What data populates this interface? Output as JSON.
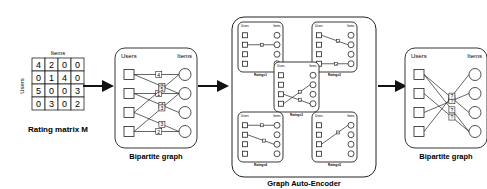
{
  "matrix": {
    "caption": "Rating matrix M",
    "col_label": "Items",
    "row_label": "Users",
    "rows": [
      [
        4,
        2,
        0,
        0
      ],
      [
        0,
        1,
        4,
        0
      ],
      [
        5,
        0,
        0,
        3
      ],
      [
        0,
        3,
        0,
        2
      ]
    ]
  },
  "bipartite_in": {
    "caption": "Bipartite graph",
    "users_label": "Users",
    "items_label": "Items",
    "edges": [
      {
        "u": 0,
        "i": 0,
        "r": "4"
      },
      {
        "u": 0,
        "i": 1,
        "r": "2"
      },
      {
        "u": 1,
        "i": 1,
        "r": "1"
      },
      {
        "u": 1,
        "i": 2,
        "r": "4"
      },
      {
        "u": 2,
        "i": 0,
        "r": "5"
      },
      {
        "u": 2,
        "i": 3,
        "r": "3"
      },
      {
        "u": 3,
        "i": 1,
        "r": "3"
      },
      {
        "u": 3,
        "i": 3,
        "r": "2"
      }
    ]
  },
  "gae": {
    "caption": "Graph Auto-Encoder",
    "subgraphs": [
      {
        "label": "Rating=1",
        "users_label": "Users",
        "items_label": "Items",
        "edges": [
          {
            "u": 1,
            "i": 1,
            "r": "1"
          }
        ]
      },
      {
        "label": "Rating=2",
        "users_label": "Users",
        "items_label": "Items",
        "edges": [
          {
            "u": 0,
            "i": 1,
            "r": "2"
          },
          {
            "u": 3,
            "i": 3,
            "r": "2"
          }
        ]
      },
      {
        "label": "Rating=3",
        "users_label": "Users",
        "items_label": "Items",
        "edges": [
          {
            "u": 2,
            "i": 3,
            "r": "3"
          },
          {
            "u": 3,
            "i": 1,
            "r": "3"
          }
        ]
      },
      {
        "label": "Rating=4",
        "users_label": "Users",
        "items_label": "Items",
        "edges": [
          {
            "u": 0,
            "i": 0,
            "r": "4"
          },
          {
            "u": 1,
            "i": 2,
            "r": "4"
          }
        ]
      },
      {
        "label": "Rating=5",
        "users_label": "Users",
        "items_label": "Items",
        "edges": [
          {
            "u": 2,
            "i": 0,
            "r": "5"
          }
        ]
      }
    ]
  },
  "bipartite_out": {
    "caption": "Bipartite graph",
    "users_label": "Users",
    "items_label": "Items",
    "edges": [
      {
        "u": 0,
        "i": 2,
        "r": "?"
      },
      {
        "u": 1,
        "i": 3,
        "r": "?"
      },
      {
        "u": 2,
        "i": 1,
        "r": "?"
      },
      {
        "u": 3,
        "i": 0,
        "r": "?"
      },
      {
        "u": 0,
        "i": 3,
        "r": "?"
      }
    ]
  }
}
